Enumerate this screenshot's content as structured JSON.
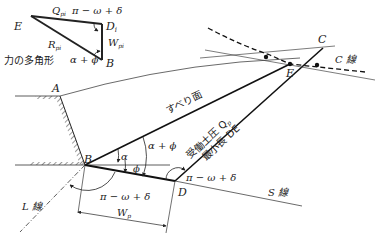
{
  "diagram": {
    "type": "force-polygon-earth-pressure",
    "force_polygon": {
      "title": "力の多角形",
      "vertices": {
        "E": "Eᵢ",
        "D": "Dᵢ",
        "B": "B"
      },
      "forces": {
        "Q": "Q",
        "Q_sub": "pi",
        "W": "W",
        "W_sub": "pi",
        "R": "R",
        "R_sub": "pi"
      },
      "angles": {
        "top": "π − ω + δ",
        "bottom": "α + ϕ"
      }
    },
    "points": {
      "A": "A",
      "B": "B",
      "C": "C",
      "D": "D",
      "E": "E"
    },
    "lines": {
      "C": "C 線",
      "S": "S 線",
      "L": "L 線"
    },
    "slip_plane": "すべり面",
    "passive_pressure": {
      "line1": "受働土圧 Q",
      "sub": "p",
      "line2": "最小長 DE"
    },
    "angles": {
      "alpha_phi": "α + ϕ",
      "alpha": "α",
      "phi": "ϕ",
      "at_D": "π − ω + δ",
      "below_B": "π − ω + δ"
    },
    "width": {
      "label": "W",
      "sub": "p"
    }
  }
}
